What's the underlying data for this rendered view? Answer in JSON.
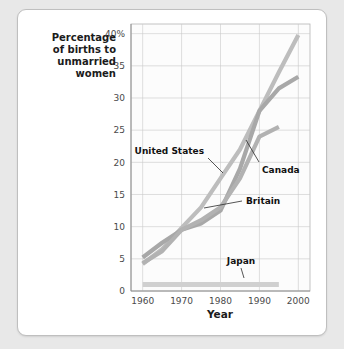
{
  "figure": {
    "background_color": "#e8e8e8",
    "card_color": "#ffffff",
    "card_border_color": "#bfbfbf"
  },
  "chart_data": {
    "type": "line",
    "title": "",
    "xlabel": "Year",
    "ylabel": "Percentage of births to unmarried women",
    "ylabel_lines": [
      "Percentage",
      "of births to",
      "unmarried",
      "women"
    ],
    "xlim": [
      1957,
      2003
    ],
    "ylim": [
      0,
      41.5
    ],
    "x_ticks": [
      1960,
      1970,
      1980,
      1990,
      2000
    ],
    "x_tick_labels": [
      "1960",
      "1970",
      "1980",
      "1990",
      "2000"
    ],
    "y_ticks": [
      0,
      5,
      10,
      15,
      20,
      25,
      30,
      35,
      40
    ],
    "y_tick_labels": [
      "0",
      "5",
      "10",
      "15",
      "20",
      "25",
      "30",
      "35",
      "40%"
    ],
    "grid": true,
    "legend": "none",
    "annotations_style": "inline-labels-with-leader-lines",
    "series": [
      {
        "name": "United States",
        "color": "#bdbdbd",
        "stroke_width": 4.2,
        "x": [
          1960,
          1965,
          1970,
          1975,
          1980,
          1985,
          1990,
          1995,
          2000
        ],
        "values": [
          4.2,
          6.5,
          9.8,
          13.0,
          17.5,
          22.0,
          28.0,
          34.0,
          39.8
        ]
      },
      {
        "name": "Britain",
        "color": "#a8a8a8",
        "stroke_width": 4.2,
        "x": [
          1960,
          1965,
          1970,
          1975,
          1980,
          1985,
          1990,
          1995,
          2000
        ],
        "values": [
          5.2,
          7.5,
          9.5,
          10.5,
          12.5,
          19.0,
          28.0,
          31.5,
          33.3
        ]
      },
      {
        "name": "Canada",
        "color": "#b2b2b2",
        "stroke_width": 4.2,
        "x": [
          1960,
          1965,
          1970,
          1975,
          1980,
          1985,
          1990,
          1995
        ],
        "values": [
          4.3,
          6.2,
          9.5,
          11.0,
          13.0,
          17.5,
          24.0,
          25.5
        ]
      },
      {
        "name": "Japan",
        "color": "#d0d0d0",
        "stroke_width": 5.0,
        "x": [
          1960,
          1970,
          1980,
          1990,
          1995
        ],
        "values": [
          1.0,
          1.0,
          1.0,
          1.0,
          1.0
        ]
      }
    ],
    "annotations": [
      {
        "label": "United States",
        "anchor_x": 1984,
        "anchor_y": 21.5
      },
      {
        "label": "Canada",
        "anchor_x": 1989,
        "anchor_y": 24.0
      },
      {
        "label": "Britain",
        "anchor_x": 1979,
        "anchor_y": 12.3
      },
      {
        "label": "Japan",
        "anchor_x": 1990,
        "anchor_y": 1.2
      }
    ]
  }
}
